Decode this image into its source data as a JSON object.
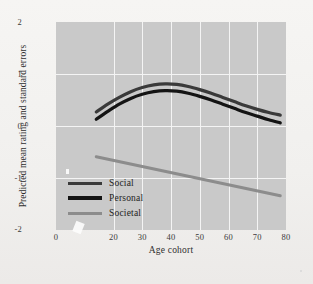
{
  "chart_data": {
    "type": "line",
    "title": "",
    "xlabel": "Age cohort",
    "ylabel": "Predicted mean rating and standard errors",
    "xlim": [
      0,
      80
    ],
    "ylim": [
      -2,
      2
    ],
    "xticks": [
      0,
      20,
      30,
      40,
      50,
      60,
      70,
      80
    ],
    "xtick_labels": [
      "0",
      "20",
      "30",
      "40",
      "50",
      "60",
      "70",
      "80"
    ],
    "yticks": [
      2,
      1,
      0,
      -1,
      -2
    ],
    "ytick_labels": [
      "2",
      "1",
      "0",
      "-1",
      "-2"
    ],
    "grid": true,
    "grid_color": "#f4f4f4",
    "plot_background": "#c9c9c9",
    "legend_position": "lower left",
    "series": [
      {
        "name": "Social",
        "color": "#3a3a3a",
        "x": [
          14,
          18,
          22,
          26,
          30,
          34,
          38,
          42,
          46,
          50,
          54,
          58,
          62,
          66,
          70,
          74,
          78
        ],
        "values": [
          0.27,
          0.42,
          0.55,
          0.66,
          0.74,
          0.79,
          0.81,
          0.8,
          0.76,
          0.7,
          0.63,
          0.55,
          0.47,
          0.39,
          0.32,
          0.26,
          0.21
        ]
      },
      {
        "name": "Personal",
        "color": "#141414",
        "x": [
          14,
          18,
          22,
          26,
          30,
          34,
          38,
          42,
          46,
          50,
          54,
          58,
          62,
          66,
          70,
          74,
          78
        ],
        "values": [
          0.13,
          0.28,
          0.42,
          0.53,
          0.61,
          0.66,
          0.68,
          0.67,
          0.63,
          0.57,
          0.5,
          0.42,
          0.34,
          0.26,
          0.19,
          0.12,
          0.06
        ]
      },
      {
        "name": "Societal",
        "color": "#8c8c8c",
        "x": [
          14,
          78
        ],
        "values": [
          -0.59,
          -1.34
        ]
      }
    ]
  },
  "legend": {
    "entries": [
      {
        "label": "Social",
        "color": "#3a3a3a"
      },
      {
        "label": "Personal",
        "color": "#141414"
      },
      {
        "label": "Societal",
        "color": "#8c8c8c"
      }
    ]
  },
  "axes": {
    "x_title": "Age cohort",
    "y_title": "Predicted mean rating and standard errors",
    "xtick_labels": [
      "0",
      "20",
      "30",
      "40",
      "50",
      "60",
      "70",
      "80"
    ],
    "ytick_labels": [
      "2",
      "1",
      "0",
      "-1",
      "-2"
    ]
  }
}
